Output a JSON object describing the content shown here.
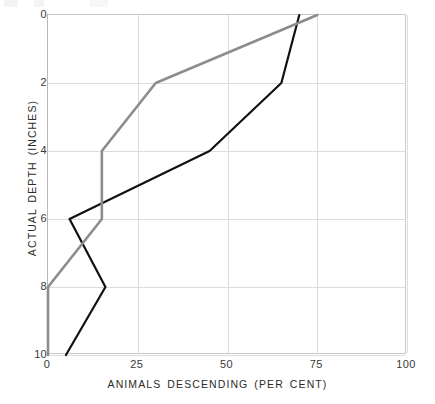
{
  "figure": {
    "background_color": "#ffffff",
    "axis_color": "#c9c9c9",
    "grid_color": "#dcdcdc",
    "tick_text_color": "#3a3a3a"
  },
  "chart_data": {
    "type": "line",
    "title": "",
    "subtitle": "",
    "xlabel": "ANIMALS DESCENDING (PER CENT)",
    "ylabel": "ACTUAL DEPTH (INCHES)",
    "xlim": [
      0,
      100
    ],
    "ylim": [
      0,
      10
    ],
    "y_inverted": true,
    "grid": true,
    "legend": "none",
    "xticks": [
      0,
      25,
      50,
      75,
      100
    ],
    "xtick_labels": [
      "0",
      "25",
      "50",
      "75",
      "100"
    ],
    "yticks": [
      0,
      2,
      4,
      6,
      8,
      10
    ],
    "ytick_labels": [
      "0",
      "2",
      "4",
      "6",
      "8",
      "10"
    ],
    "depths": [
      0,
      2,
      4,
      6,
      8,
      10
    ],
    "series": [
      {
        "name": "series-black",
        "color": "#111111",
        "linewidth": 2.2,
        "values": [
          70,
          65,
          45,
          6,
          16,
          5
        ]
      },
      {
        "name": "series-gray",
        "color": "#8c8c8c",
        "linewidth": 2.6,
        "values": [
          75,
          30,
          15,
          15,
          0,
          0
        ]
      }
    ]
  }
}
